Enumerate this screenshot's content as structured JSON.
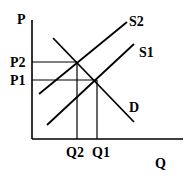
{
  "diagram": {
    "title": "",
    "axes": {
      "y_label": "P",
      "x_label": "Q"
    },
    "curves": [
      {
        "name": "S2",
        "label": "S2",
        "type": "supply",
        "from": [
          39,
          94
        ],
        "to": [
          127,
          22
        ]
      },
      {
        "name": "S1",
        "label": "S1",
        "type": "supply",
        "from": [
          47,
          125
        ],
        "to": [
          134,
          44
        ]
      },
      {
        "name": "D",
        "label": "D",
        "type": "demand",
        "from": [
          53,
          38
        ],
        "to": [
          134,
          122
        ]
      }
    ],
    "price_levels": [
      {
        "label": "P2",
        "y": 62
      },
      {
        "label": "P1",
        "y": 80
      }
    ],
    "quantity_levels": [
      {
        "label": "Q2",
        "x": 77
      },
      {
        "label": "Q1",
        "x": 97
      }
    ],
    "equilibria": [
      {
        "name": "E2",
        "curves": [
          "S2",
          "D"
        ],
        "price": "P2",
        "quantity": "Q2"
      },
      {
        "name": "E1",
        "curves": [
          "S1",
          "D"
        ],
        "price": "P1",
        "quantity": "Q1"
      }
    ]
  }
}
